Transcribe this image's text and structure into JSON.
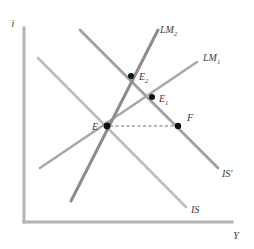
{
  "figure": {
    "background": "#ffffff"
  },
  "axes": {
    "y_axis_label": "i",
    "x_axis_label": "Y",
    "axis_color": "#b3b3b3",
    "origin": {
      "x": 24,
      "y": 222
    },
    "y_top": 28,
    "x_right": 232
  },
  "colors": {
    "lm2": "#8c8c8c",
    "lm1": "#a8a8a8",
    "is_prime": "#a0a0a0",
    "is": "#bdbdbd",
    "point": "#111111",
    "dashed": "#6f6f6f",
    "label": "#3a3a3a",
    "axis": "#b3b3b3"
  },
  "curves": [
    {
      "id": "lm1",
      "label": "LM",
      "subscript": "1",
      "color": "#a8a8a8",
      "width": 2.6,
      "x1": 40,
      "y1": 168,
      "x2": 197,
      "y2": 62,
      "label_x": 203,
      "label_y": 61
    },
    {
      "id": "lm2",
      "label": "LM",
      "subscript": "2",
      "color": "#8c8c8c",
      "width": 3.0,
      "x1": 71,
      "y1": 201,
      "x2": 158,
      "y2": 30,
      "label_x": 160,
      "label_y": 33
    },
    {
      "id": "is",
      "label": "IS",
      "subscript": "",
      "color": "#bdbdbd",
      "width": 2.6,
      "x1": 38,
      "y1": 58,
      "x2": 186,
      "y2": 207,
      "label_x": 191,
      "label_y": 213
    },
    {
      "id": "is-prime",
      "label": "IS′",
      "subscript": "",
      "color": "#a0a0a0",
      "width": 2.8,
      "x1": 80,
      "y1": 30,
      "x2": 218,
      "y2": 168,
      "label_x": 222,
      "label_y": 177
    }
  ],
  "dashed_segment": {
    "from": {
      "x": 110,
      "y": 126
    },
    "to": {
      "x": 176,
      "y": 126
    },
    "color": "#6f6f6f",
    "dash": "3 2.5"
  },
  "points": [
    {
      "id": "E",
      "label": "E",
      "subscript": "",
      "x": 107,
      "y": 126,
      "r": 3.4,
      "label_x": 92,
      "label_y": 129,
      "anchor": "end"
    },
    {
      "id": "E1",
      "label": "E",
      "subscript": "1",
      "x": 152,
      "y": 97,
      "r": 3.0,
      "label_x": 159,
      "label_y": 102,
      "anchor": "start"
    },
    {
      "id": "E2",
      "label": "E",
      "subscript": "2",
      "x": 131,
      "y": 76,
      "r": 3.0,
      "label_x": 139,
      "label_y": 80,
      "anchor": "start"
    },
    {
      "id": "F",
      "label": "F",
      "subscript": "",
      "x": 178,
      "y": 126,
      "r": 3.2,
      "label_x": 186,
      "label_y": 121,
      "anchor": "start"
    }
  ],
  "chart_data": {
    "type": "line",
    "xlabel": "Y",
    "ylabel": "i",
    "grid": false,
    "legend": "inline-curve-labels",
    "series": [
      {
        "name": "LM1",
        "note": "upward sloping money market curve, original"
      },
      {
        "name": "LM2",
        "note": "upward sloping money market curve, shifted left/steeper"
      },
      {
        "name": "IS",
        "note": "downward sloping goods market curve, original"
      },
      {
        "name": "IS′",
        "note": "downward sloping goods market curve, shifted right"
      }
    ],
    "annotations": [
      {
        "label": "E",
        "description": "intersection of IS and LM1"
      },
      {
        "label": "E1",
        "description": "intersection of IS′ and LM1"
      },
      {
        "label": "E2",
        "description": "intersection of IS′ and LM2"
      },
      {
        "label": "F",
        "description": "point on IS′ at the same interest rate as E"
      }
    ]
  }
}
